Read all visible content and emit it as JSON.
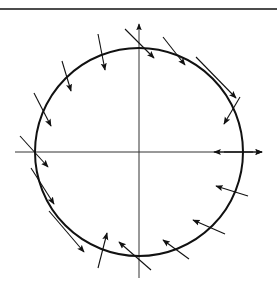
{
  "diagram": {
    "type": "vector-field-on-circle",
    "colors": {
      "stroke": "#111111",
      "background": "#ffffff"
    },
    "top_rule": {
      "x1": 0,
      "y1": 9,
      "x2": 277,
      "y2": 9
    },
    "circle": {
      "cx": 139,
      "cy": 152,
      "r": 104
    },
    "axes": {
      "horizontal": {
        "x1": 15,
        "y1": 152,
        "x2": 262,
        "y2": 152,
        "arrow_end": true
      },
      "vertical": {
        "x1": 139,
        "y1": 278,
        "x2": 139,
        "y2": 24,
        "arrow_end": true
      }
    },
    "arrows": [
      {
        "x1": 125,
        "y1": 29,
        "x2": 154,
        "y2": 58
      },
      {
        "x1": 98,
        "y1": 34,
        "x2": 105,
        "y2": 70
      },
      {
        "x1": 62,
        "y1": 61,
        "x2": 71,
        "y2": 91
      },
      {
        "x1": 34,
        "y1": 93,
        "x2": 51,
        "y2": 126
      },
      {
        "x1": 20,
        "y1": 136,
        "x2": 48,
        "y2": 167
      },
      {
        "x1": 31,
        "y1": 168,
        "x2": 54,
        "y2": 204
      },
      {
        "x1": 49,
        "y1": 211,
        "x2": 84,
        "y2": 252
      },
      {
        "x1": 98,
        "y1": 268,
        "x2": 107,
        "y2": 233
      },
      {
        "x1": 151,
        "y1": 270,
        "x2": 119,
        "y2": 242
      },
      {
        "x1": 189,
        "y1": 259,
        "x2": 163,
        "y2": 240
      },
      {
        "x1": 225,
        "y1": 234,
        "x2": 193,
        "y2": 220
      },
      {
        "x1": 248,
        "y1": 196,
        "x2": 216,
        "y2": 186
      },
      {
        "x1": 240,
        "y1": 97,
        "x2": 224,
        "y2": 124
      },
      {
        "x1": 196,
        "y1": 57,
        "x2": 236,
        "y2": 98
      },
      {
        "x1": 163,
        "y1": 37,
        "x2": 185,
        "y2": 65
      },
      {
        "x1": 253,
        "y1": 152,
        "x2": 214,
        "y2": 152
      },
      {
        "x1": 224,
        "y1": 152,
        "x2": 262,
        "y2": 152
      }
    ]
  }
}
